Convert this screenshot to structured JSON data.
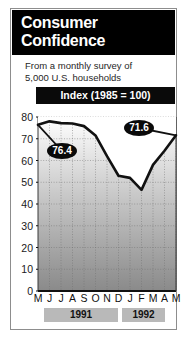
{
  "header": {
    "title": "Consumer\nConfidence"
  },
  "subtitle": {
    "text": "From a monthly survey of\n5,000 U.S. households"
  },
  "index_band": {
    "label": "Index (1985 = 100)"
  },
  "colors": {
    "header_bg": "#000000",
    "band_bg": "#0a0a0a",
    "line": "#111111",
    "plot_top": "#ffffff",
    "plot_bottom": "#8f8f8f",
    "year_band_bg": "#b9b9b9",
    "frame_border": "#8d8d8d"
  },
  "callouts": [
    {
      "name": "first-value",
      "value": "76.4",
      "x": 47,
      "y": 143
    },
    {
      "name": "last-value",
      "value": "71.6",
      "x": 124,
      "y": 120
    }
  ],
  "year_bands": [
    {
      "label": "1991",
      "left": 44,
      "width": 74
    },
    {
      "label": "1992",
      "left": 122,
      "width": 43
    }
  ],
  "chart_data": {
    "type": "line",
    "title": "Consumer Confidence",
    "subtitle": "From a monthly survey of 5,000 U.S. households",
    "xlabel": "",
    "ylabel": "Index (1985 = 100)",
    "ylim": [
      0,
      80
    ],
    "yticks": [
      80,
      70,
      60,
      50,
      40,
      30,
      20,
      10,
      0
    ],
    "categories": [
      "M",
      "J",
      "J",
      "A",
      "S",
      "O",
      "N",
      "D",
      "J",
      "F",
      "M",
      "A",
      "M"
    ],
    "years": [
      "1991",
      "1991",
      "1991",
      "1991",
      "1991",
      "1991",
      "1991",
      "1991",
      "1992",
      "1992",
      "1992",
      "1992",
      "1992"
    ],
    "values": [
      76.4,
      78.0,
      77.2,
      77.0,
      75.8,
      71.5,
      62.0,
      53.0,
      52.0,
      46.5,
      58.0,
      64.5,
      71.6
    ],
    "grid": true,
    "legend": false,
    "annotations": [
      {
        "label": "76.4",
        "category_index": 0,
        "value": 76.4
      },
      {
        "label": "71.6",
        "category_index": 12,
        "value": 71.6
      }
    ]
  }
}
